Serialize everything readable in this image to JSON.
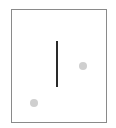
{
  "diagram": {
    "frame": {
      "border_color": "#8a8a8a",
      "background": "#ffffff"
    },
    "elements": [
      {
        "type": "line",
        "orientation": "vertical",
        "color": "#2a2a2a",
        "x": 57,
        "y1": 41,
        "y2": 87
      },
      {
        "type": "dot",
        "color": "#cfcfcf",
        "cx": 83,
        "cy": 66,
        "diameter": 8
      },
      {
        "type": "dot",
        "color": "#cfcfcf",
        "cx": 34,
        "cy": 103,
        "diameter": 8
      }
    ]
  }
}
